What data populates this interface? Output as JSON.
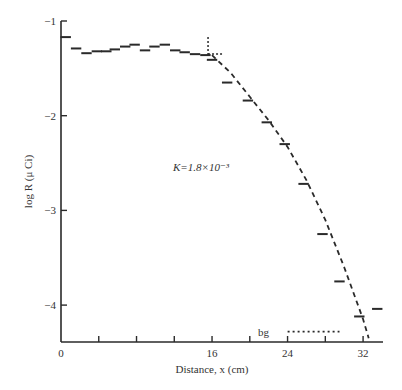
{
  "chart_data": {
    "type": "line",
    "title": "",
    "xlabel": "Distance, x (cm)",
    "ylabel": "log R (μ Ci)",
    "xlim": [
      0,
      35
    ],
    "ylim": [
      -4.4,
      -1
    ],
    "x_ticks": [
      0,
      4,
      8,
      12,
      16,
      20,
      24,
      28,
      32
    ],
    "x_tick_labels": [
      "0",
      "",
      "",
      "",
      "16",
      "",
      "24",
      "",
      "32"
    ],
    "y_ticks": [
      -1,
      -2,
      -3,
      -4
    ],
    "y_tick_labels": [
      "−1",
      "−2",
      "−3",
      "−4"
    ],
    "grid": false,
    "annotation": "K=1.8×10⁻³",
    "background_label": "bg",
    "series": [
      {
        "name": "measured (histogram steps)",
        "style": "steps",
        "x": [
          0.5,
          1.6,
          2.7,
          3.8,
          4.8,
          5.7,
          6.8,
          7.8,
          8.9,
          9.9,
          11.0,
          12.1,
          13.1,
          14.2,
          15.3,
          16.0,
          17.6,
          19.8,
          21.8,
          23.7,
          25.7,
          27.7,
          29.5,
          31.6,
          33.5
        ],
        "values": [
          -1.17,
          -1.29,
          -1.34,
          -1.32,
          -1.32,
          -1.3,
          -1.27,
          -1.25,
          -1.31,
          -1.27,
          -1.25,
          -1.31,
          -1.33,
          -1.35,
          -1.36,
          -1.41,
          -1.65,
          -1.84,
          -2.07,
          -2.3,
          -2.72,
          -3.25,
          -3.75,
          -4.12,
          -4.04
        ]
      },
      {
        "name": "fit K=1.8×10⁻³",
        "style": "dashed",
        "x": [
          16,
          18,
          20,
          22,
          24,
          26,
          28,
          30,
          32,
          32.6
        ],
        "values": [
          -1.36,
          -1.55,
          -1.8,
          -2.05,
          -2.33,
          -2.68,
          -3.1,
          -3.6,
          -4.15,
          -4.35
        ]
      },
      {
        "name": "background",
        "style": "dotted",
        "x": [
          24,
          29.5
        ],
        "values": [
          -4.28,
          -4.28
        ]
      }
    ]
  }
}
